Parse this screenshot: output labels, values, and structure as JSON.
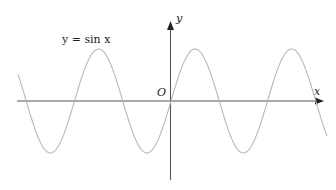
{
  "chart_data": {
    "type": "line",
    "title": "",
    "function": "y = sin x",
    "annotation": "y = sin x",
    "xlabel": "x",
    "ylabel": "y",
    "origin_label": "O",
    "grid": false,
    "legend": "none",
    "axis_ticks": [],
    "series": [
      {
        "name": "y = sin x",
        "color": "#b8b8b8",
        "x": [
          -7.0,
          -6.28,
          -4.71,
          -3.14,
          -1.57,
          0,
          1.57,
          3.14,
          4.71,
          6.28,
          7.85,
          9.42,
          10.2
        ],
        "values": [
          -0.66,
          0,
          1,
          0,
          -1,
          0,
          1,
          0,
          -1,
          0,
          1,
          0,
          -0.7
        ]
      }
    ],
    "xlim": [
      -10.0,
      10.2
    ],
    "ylim": [
      -1.5,
      1.5
    ]
  },
  "labels": {
    "equation": "y = sin x",
    "x_axis": "x",
    "y_axis": "y",
    "origin": "O"
  },
  "colors": {
    "axis": "#555555",
    "curve": "#b8b8b8",
    "text": "#222222"
  }
}
